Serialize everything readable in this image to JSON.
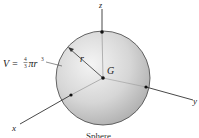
{
  "diagram": {
    "title": "Sphere",
    "formula": {
      "prefix": "V = ",
      "numerator": "4",
      "denominator": "3",
      "suffix": "πr",
      "exponent": "3"
    },
    "labels": {
      "z_axis": "z",
      "y_axis": "y",
      "x_axis": "x",
      "center": "G",
      "radius": "r"
    },
    "colors": {
      "sphere_light": "#f2f2f2",
      "sphere_dark": "#a8a8a8",
      "outline": "#555555",
      "lines": "#333333"
    }
  }
}
